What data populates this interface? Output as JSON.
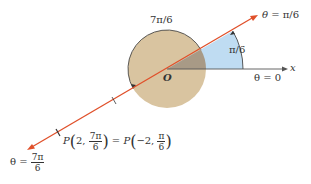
{
  "diagram": {
    "title_arc_label": "7π/6",
    "ray_upper_label_theta": "θ",
    "ray_upper_label_value": "= π/6",
    "angle_label": "π/6",
    "x_axis_label": "x",
    "theta_zero_label": "θ = 0",
    "origin_label": "O",
    "point_label": {
      "P1": "P",
      "r1": "2,",
      "num1": "7π",
      "den1": "6",
      "equals": "=",
      "P2": "P",
      "r2": "−2,",
      "num2": "π",
      "den2": "6"
    },
    "ray_lower_label": {
      "theta": "θ =",
      "num": "7π",
      "den": "6"
    },
    "colors": {
      "line": "#e0502a",
      "circle_fill": "#d9c4a0",
      "sector_fill": "#bfdcf2",
      "sector_overlap": "#a89a86",
      "axis": "#555555"
    }
  }
}
